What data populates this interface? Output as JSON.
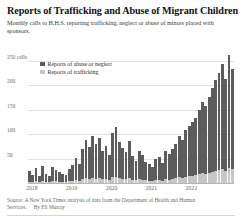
{
  "header": {
    "title": "Reports of Trafficking and Abuse of Migrant Children",
    "subtitle": "Monthly calls to H.H.S. reporting trafficking, neglect or abuse of minors placed with sponsors."
  },
  "legend": {
    "items": [
      {
        "label": "Reports of abuse or neglect",
        "color": "#5c5c5c",
        "key": "abuse"
      },
      {
        "label": "Reports of trafficking",
        "color": "#c6c6c6",
        "key": "trafficking"
      }
    ]
  },
  "footer": {
    "source": "Source: A New York Times analysis of data from the Department of Health and Human Services.",
    "byline": "By Eli Murray"
  },
  "chart_data": {
    "type": "bar",
    "stacked": true,
    "title": "Reports of Trafficking and Abuse of Migrant Children",
    "subtitle": "Monthly calls to H.H.S. reporting trafficking, neglect or abuse of minors placed with sponsors.",
    "xlabel": "",
    "ylabel": "calls",
    "ylim": [
      0,
      262
    ],
    "yticks": [
      50,
      100,
      150,
      200,
      250
    ],
    "ytick_labels": [
      "50",
      "100",
      "150",
      "200",
      "250 calls"
    ],
    "grid": true,
    "legend_position": "top-left-inside",
    "xtick_labels": [
      "2018",
      "2019",
      "2020",
      "2021",
      "2022"
    ],
    "xtick_months": [
      "2018-01",
      "2019-01",
      "2020-01",
      "2021-01",
      "2022-01"
    ],
    "x": [
      "2018-01",
      "2018-02",
      "2018-03",
      "2018-04",
      "2018-05",
      "2018-06",
      "2018-07",
      "2018-08",
      "2018-09",
      "2018-10",
      "2018-11",
      "2018-12",
      "2019-01",
      "2019-02",
      "2019-03",
      "2019-04",
      "2019-05",
      "2019-06",
      "2019-07",
      "2019-08",
      "2019-09",
      "2019-10",
      "2019-11",
      "2019-12",
      "2020-01",
      "2020-02",
      "2020-03",
      "2020-04",
      "2020-05",
      "2020-06",
      "2020-07",
      "2020-08",
      "2020-09",
      "2020-10",
      "2020-11",
      "2020-12",
      "2021-01",
      "2021-02",
      "2021-03",
      "2021-04",
      "2021-05",
      "2021-06",
      "2021-07",
      "2021-08",
      "2021-09",
      "2021-10",
      "2021-11",
      "2021-12",
      "2022-01",
      "2022-02",
      "2022-03",
      "2022-04",
      "2022-05",
      "2022-06",
      "2022-07",
      "2022-08",
      "2022-09",
      "2022-10",
      "2022-11",
      "2022-12",
      "2023-01",
      "2023-02"
    ],
    "series": [
      {
        "name": "Reports of abuse or neglect",
        "color": "#5c5c5c",
        "values": [
          22,
          14,
          26,
          12,
          30,
          16,
          13,
          29,
          23,
          19,
          15,
          14,
          24,
          31,
          46,
          34,
          61,
          78,
          64,
          86,
          71,
          82,
          57,
          66,
          51,
          90,
          101,
          73,
          62,
          55,
          76,
          48,
          40,
          57,
          50,
          38,
          33,
          29,
          43,
          47,
          36,
          58,
          52,
          61,
          69,
          84,
          78,
          95,
          103,
          110,
          118,
          132,
          146,
          138,
          156,
          172,
          185,
          198,
          214,
          188,
          232,
          205
        ]
      },
      {
        "name": "Reports of trafficking",
        "color": "#c6c6c6",
        "values": [
          3,
          2,
          4,
          2,
          4,
          3,
          2,
          4,
          4,
          3,
          3,
          2,
          4,
          5,
          6,
          5,
          8,
          10,
          9,
          11,
          9,
          11,
          8,
          9,
          7,
          12,
          13,
          10,
          9,
          8,
          10,
          7,
          6,
          8,
          7,
          6,
          5,
          4,
          6,
          7,
          5,
          8,
          7,
          9,
          10,
          12,
          11,
          13,
          14,
          15,
          16,
          18,
          20,
          19,
          21,
          23,
          25,
          27,
          29,
          25,
          31,
          28
        ]
      }
    ]
  }
}
